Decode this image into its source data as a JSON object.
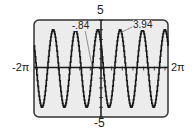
{
  "chart_data": {
    "type": "line",
    "title": "",
    "xlabel": "",
    "ylabel": "",
    "xlim": [
      "-2π",
      "2π"
    ],
    "xlim_numeric": [
      -6.2832,
      6.2832
    ],
    "ylim": [
      -5,
      5
    ],
    "grid": false,
    "legend": null,
    "tick_labels": {
      "x_min": "-2π",
      "x_max": "2π",
      "y_max": "5",
      "y_min": "-5"
    },
    "function_model": {
      "form": "A*sin(B*x + C)",
      "A": 4,
      "B": 3,
      "C": 2.52,
      "samples": 240
    },
    "annotations": [
      {
        "text": "-.84",
        "x": -0.84,
        "y": 0,
        "meaning": "zero crossing"
      },
      {
        "text": "3.94",
        "x": 1.69,
        "y": 3.94,
        "meaning": "local maximum"
      }
    ],
    "colors": {
      "frame_bg": "#ececec",
      "frame_border": "#333333",
      "curve": "#1a1a1a",
      "axis": "#1a1a1a"
    }
  },
  "labels": {
    "y_top": "5",
    "y_bottom": "-5",
    "x_left": "-2π",
    "x_right": "2π",
    "ann_root": "-.84",
    "ann_max": "3.94"
  }
}
